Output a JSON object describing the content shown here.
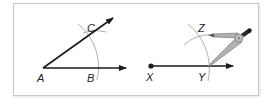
{
  "diagram": {
    "left_panel": {
      "points": {
        "A": {
          "label": "A",
          "x": 43,
          "y": 68
        },
        "B": {
          "label": "B",
          "x": 97,
          "y": 68
        },
        "C": {
          "label": "C",
          "x": 94,
          "y": 32
        }
      },
      "rays": [
        {
          "name": "ray-AB",
          "from": "A",
          "to": [
            126,
            68
          ]
        },
        {
          "name": "ray-AC",
          "from": "A",
          "to": [
            113,
            18
          ]
        }
      ],
      "arcs": [
        {
          "name": "arc-centered-A",
          "center": "A",
          "radius": 55
        },
        {
          "name": "arc-centered-B",
          "center": "B",
          "radius": 38
        }
      ]
    },
    "right_panel": {
      "points": {
        "X": {
          "label": "X",
          "x": 151,
          "y": 66
        },
        "Y": {
          "label": "Y",
          "x": 208,
          "y": 66
        },
        "Z": {
          "label": "Z",
          "x": 202,
          "y": 32
        }
      },
      "rays": [
        {
          "name": "ray-XY",
          "from": "X",
          "to": [
            233,
            66
          ]
        }
      ],
      "arcs": [
        {
          "name": "arc-centered-X",
          "center": "X",
          "radius": 57
        },
        {
          "name": "arc-centered-Y",
          "center": "Y",
          "radius": 38
        }
      ],
      "tool": "compass"
    },
    "colors": {
      "line": "#1a1a1a",
      "arc": "#9a9a9a",
      "compass_fill": "#b0b0b0",
      "compass_stroke": "#6e6e6e",
      "frame": "#c8c8c8"
    }
  }
}
